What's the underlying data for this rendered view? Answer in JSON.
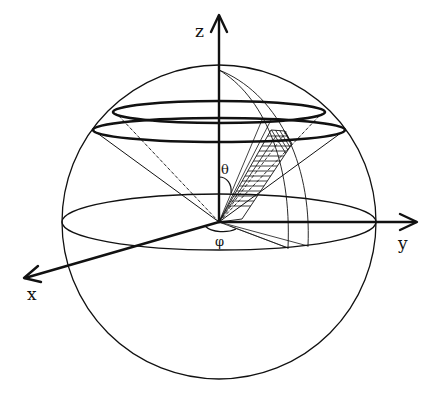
{
  "figure": {
    "colors": {
      "stroke": "#111111",
      "background": "#ffffff"
    }
  },
  "axes": {
    "x": {
      "label": "x"
    },
    "y": {
      "label": "y"
    },
    "z": {
      "label": "z"
    }
  },
  "angles": {
    "theta": {
      "label": "θ"
    },
    "phi": {
      "label": "φ"
    }
  }
}
